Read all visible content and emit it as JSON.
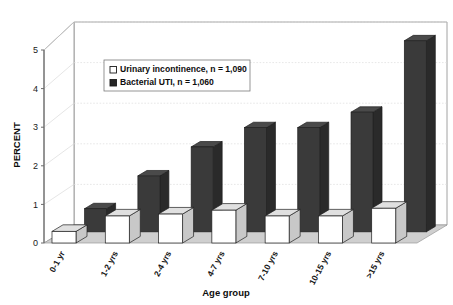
{
  "chart_data": {
    "type": "bar",
    "title": "",
    "xlabel": "Age group",
    "ylabel": "PERCENT",
    "categories": [
      "0-1 yr",
      "1-2 yrs",
      "2-4 yrs",
      "4-7 yrs",
      "7-10 yrs",
      "10-15 yrs",
      ">15 yrs"
    ],
    "series": [
      {
        "name": "Urinary incontinence, n = 1,090",
        "short_name": "Urinary incontinence",
        "n": "1,090",
        "color": "#ffffff",
        "values": [
          0.3,
          0.7,
          0.75,
          0.85,
          0.7,
          0.7,
          0.9
        ]
      },
      {
        "name": "Bacterial UTI, n = 1,060",
        "short_name": "Bacterial UTI",
        "n": "1,060",
        "color": "#3a3a3a",
        "values": [
          0.6,
          1.45,
          2.2,
          2.7,
          2.7,
          3.1,
          4.95
        ]
      }
    ],
    "ylim": [
      0,
      5
    ],
    "yticks": [
      "0",
      "1",
      "2",
      "3",
      "4",
      "5"
    ],
    "ytick_values": [
      0,
      1,
      2,
      3,
      4,
      5
    ],
    "grid": true,
    "legend_position": "upper-left-inside",
    "projection": "3d-isometric"
  },
  "legend": {
    "entries": [
      {
        "swatch": "white-square-swatch",
        "label": "Urinary incontinence, n = 1,090"
      },
      {
        "swatch": "black-square-swatch",
        "label": "Bacterial UTI, n = 1,060"
      }
    ]
  },
  "colors": {
    "bar_dark": "#3a3a3a",
    "bar_dark_side": "#2a2a2a",
    "bar_light": "#ffffff",
    "bar_light_side": "#c8c8c8",
    "bar_light_top": "#e0e0e0",
    "floor": "#cfcfcf",
    "back_wall": "#ffffff",
    "axis_line": "#6b6b6b",
    "grid_line": "#d8d8d8",
    "text": "#0d0d0d"
  }
}
